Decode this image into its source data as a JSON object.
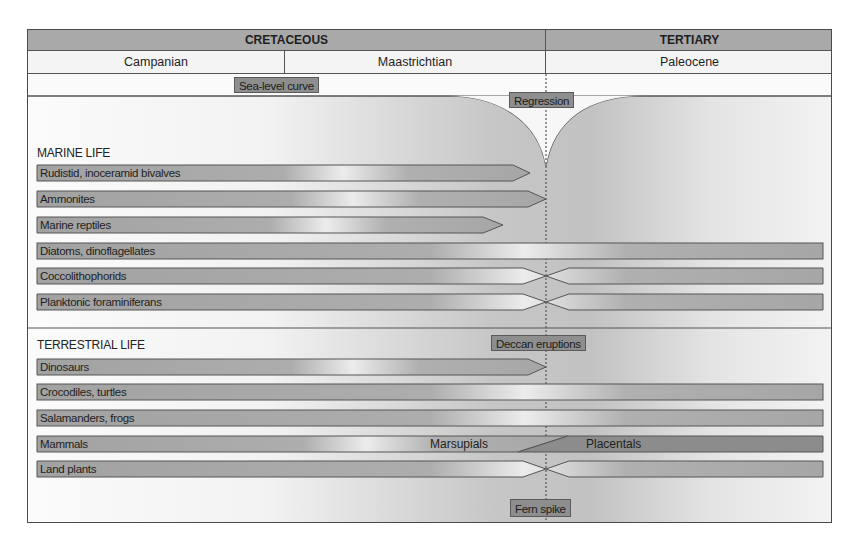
{
  "header": {
    "eras": [
      {
        "label": "CRETACEOUS"
      },
      {
        "label": "TERTIARY"
      }
    ],
    "stages": [
      {
        "label": "Campanian"
      },
      {
        "label": "Maastrichtian"
      },
      {
        "label": "Paleocene"
      }
    ]
  },
  "annotations": {
    "sea_level": "Sea-level curve",
    "regression": "Regression",
    "deccan": "Deccan eruptions",
    "fern_spike": "Fern spike"
  },
  "marine": {
    "title": "MARINE LIFE",
    "rows": [
      {
        "label": "Rudistid, inoceramid bivalves",
        "fate": "extinct before boundary"
      },
      {
        "label": "Ammonites",
        "fate": "extinct at boundary"
      },
      {
        "label": "Marine reptiles",
        "fate": "extinct before boundary"
      },
      {
        "label": "Diatoms, dinoflagellates",
        "fate": "survive"
      },
      {
        "label": "Coccolithophorids",
        "fate": "bottleneck, survive"
      },
      {
        "label": "Planktonic foraminiferans",
        "fate": "bottleneck, survive"
      }
    ]
  },
  "terrestrial": {
    "title": "TERRESTRIAL LIFE",
    "rows": [
      {
        "label": "Dinosaurs",
        "fate": "extinct at boundary"
      },
      {
        "label": "Crocodiles, turtles",
        "fate": "survive"
      },
      {
        "label": "Salamanders, frogs",
        "fate": "survive"
      },
      {
        "label": "Mammals",
        "fate": "transition",
        "left_label": "Marsupials",
        "right_label": "Placentals"
      },
      {
        "label": "Land plants",
        "fate": "bottleneck, survive"
      }
    ]
  },
  "colors": {
    "bar_fill": "#a4a4a4",
    "bar_stroke": "#555555",
    "placentals_fill": "#8a8a8a",
    "header_fill": "#a9a9a9",
    "tag_fill": "#8e8e8e"
  }
}
